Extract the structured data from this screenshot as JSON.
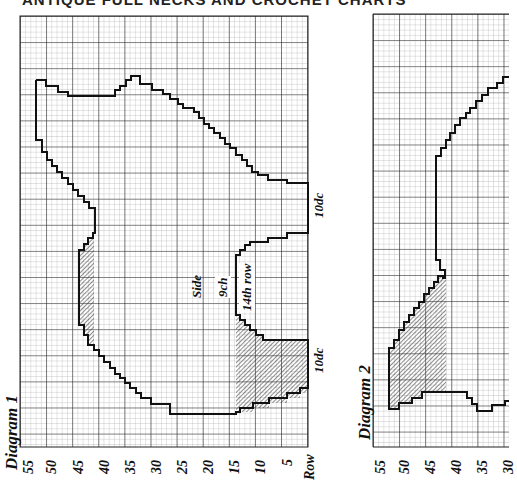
{
  "page": {
    "title": "ANTIQUE FULL NECKS AND CROCHET CHARTS"
  },
  "diagram1": {
    "label": "Diagram 1",
    "grid": {
      "x0": 20,
      "y0": 16,
      "x1": 308,
      "y1": 447,
      "cell": 5.22
    },
    "axis_label": "Row",
    "row_ticks": [
      "55",
      "50",
      "45",
      "40",
      "35",
      "30",
      "25",
      "20",
      "15",
      "10",
      "5"
    ],
    "annotations": {
      "side": "Side",
      "chain": "9ch",
      "row_marker": "14th row",
      "top_dc": "10dc",
      "bottom_dc": "10dc"
    }
  },
  "diagram2": {
    "label": "Diagram 2",
    "grid": {
      "x0": 373,
      "y0": 14,
      "x1": 509,
      "y1": 447,
      "cell": 5.22
    },
    "row_ticks": [
      "55",
      "50",
      "45",
      "40",
      "35",
      "30"
    ]
  },
  "colors": {
    "grid_minor": "#9a9a9a",
    "grid_major": "#222222",
    "outline": "#111111",
    "hatch": "#333333",
    "background": "#ffffff"
  }
}
